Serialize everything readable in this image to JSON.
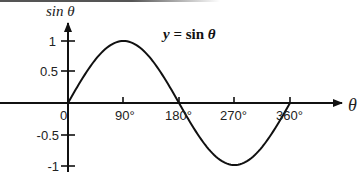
{
  "chart_data": {
    "type": "line",
    "title": "y = sin θ",
    "formula_parts": {
      "y": "y",
      "eq": " = sin ",
      "theta": "θ"
    },
    "xlabel": "θ",
    "ylabel": "sin θ",
    "x_ticks": [
      "0",
      "90°",
      "180°",
      "270°",
      "360°"
    ],
    "x_tick_values": [
      0,
      90,
      180,
      270,
      360
    ],
    "y_ticks": [
      "1",
      "0.5",
      "-0.5",
      "-1"
    ],
    "y_tick_values": [
      1,
      0.5,
      -0.5,
      -1
    ],
    "xlim": [
      0,
      360
    ],
    "ylim": [
      -1,
      1
    ],
    "grid": false,
    "legend": "none",
    "series": [
      {
        "name": "sin θ",
        "x": [
          0,
          30,
          60,
          90,
          120,
          150,
          180,
          210,
          240,
          270,
          300,
          330,
          360
        ],
        "values": [
          0,
          0.5,
          0.866,
          1,
          0.866,
          0.5,
          0,
          -0.5,
          -0.866,
          -1,
          -0.866,
          -0.5,
          0
        ]
      }
    ]
  }
}
